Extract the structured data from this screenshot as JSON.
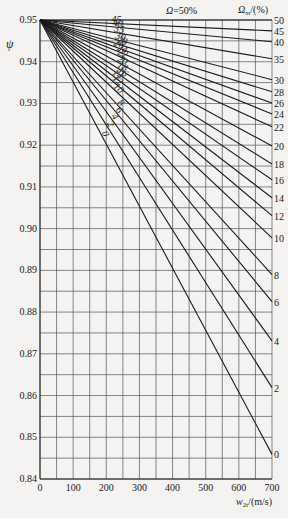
{
  "chart_data": {
    "type": "line",
    "title": "",
    "xlabel": "w_2t/(m/s)",
    "ylabel": "ψ",
    "xlim": [
      0,
      700
    ],
    "ylim": [
      0.84,
      0.95
    ],
    "x_ticks": [
      "0",
      "100",
      "200",
      "300",
      "400",
      "500",
      "600",
      "700"
    ],
    "y_ticks": [
      "0.84",
      "0.85",
      "0.86",
      "0.87",
      "0.88",
      "0.89",
      "0.90",
      "0.91",
      "0.92",
      "0.93",
      "0.94",
      "0.95"
    ],
    "grid": true,
    "legend_title_left": "Ω=50%",
    "legend_title_right": "Ω_m/(%)",
    "series": [
      {
        "name": "50",
        "x": [
          0,
          700
        ],
        "y": [
          0.95,
          0.95
        ]
      },
      {
        "name": "45",
        "x": [
          0,
          700
        ],
        "y": [
          0.95,
          0.9474
        ]
      },
      {
        "name": "40",
        "x": [
          0,
          700
        ],
        "y": [
          0.95,
          0.9448
        ]
      },
      {
        "name": "35",
        "x": [
          0,
          700
        ],
        "y": [
          0.95,
          0.9407
        ]
      },
      {
        "name": "30",
        "x": [
          0,
          700
        ],
        "y": [
          0.95,
          0.9357
        ]
      },
      {
        "name": "28",
        "x": [
          0,
          700
        ],
        "y": [
          0.95,
          0.9328
        ]
      },
      {
        "name": "26",
        "x": [
          0,
          700
        ],
        "y": [
          0.95,
          0.9301
        ]
      },
      {
        "name": "24",
        "x": [
          0,
          700
        ],
        "y": [
          0.95,
          0.9275
        ]
      },
      {
        "name": "22",
        "x": [
          0,
          700
        ],
        "y": [
          0.95,
          0.9244
        ]
      },
      {
        "name": "20",
        "x": [
          0,
          700
        ],
        "y": [
          0.95,
          0.9198
        ]
      },
      {
        "name": "18",
        "x": [
          0,
          700
        ],
        "y": [
          0.95,
          0.9155
        ]
      },
      {
        "name": "16",
        "x": [
          0,
          700
        ],
        "y": [
          0.95,
          0.9117
        ]
      },
      {
        "name": "14",
        "x": [
          0,
          700
        ],
        "y": [
          0.95,
          0.9074
        ]
      },
      {
        "name": "12",
        "x": [
          0,
          700
        ],
        "y": [
          0.95,
          0.9031
        ]
      },
      {
        "name": "10",
        "x": [
          0,
          700
        ],
        "y": [
          0.95,
          0.8978
        ]
      },
      {
        "name": "8",
        "x": [
          0,
          700
        ],
        "y": [
          0.95,
          0.889
        ]
      },
      {
        "name": "6",
        "x": [
          0,
          700
        ],
        "y": [
          0.95,
          0.8825
        ]
      },
      {
        "name": "4",
        "x": [
          0,
          700
        ],
        "y": [
          0.95,
          0.8731
        ]
      },
      {
        "name": "2",
        "x": [
          0,
          700
        ],
        "y": [
          0.95,
          0.8619
        ]
      },
      {
        "name": "0",
        "x": [
          0,
          700
        ],
        "y": [
          0.95,
          0.8459
        ]
      }
    ],
    "inline_labels": [
      "45",
      "40",
      "35",
      "30",
      "28",
      "26",
      "24",
      "22",
      "20",
      "18",
      "16",
      "14",
      "12",
      "10",
      "8",
      "6",
      "4",
      "2",
      "0"
    ],
    "right_labels": [
      "50",
      "45",
      "40",
      "35",
      "30",
      "28",
      "26",
      "24",
      "22",
      "20",
      "18",
      "16",
      "14",
      "12",
      "10",
      "8",
      "6",
      "4",
      "2",
      "0"
    ]
  }
}
